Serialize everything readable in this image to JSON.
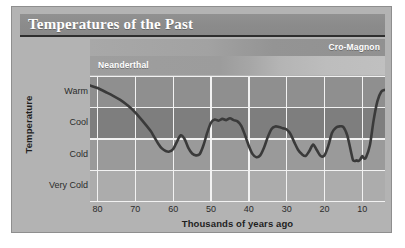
{
  "figure": {
    "title": "Temperatures of the Past",
    "border_color": "#8e8e8e",
    "panel_color": "#b3b3b3",
    "title_bar_color": "#8b8b8b"
  },
  "eras": [
    {
      "name": "cro-magnon",
      "label": "Cro-Magnon",
      "align": "right"
    },
    {
      "name": "neanderthal",
      "label": "Neanderthal",
      "align": "left"
    }
  ],
  "chart_data": {
    "type": "line",
    "title": "Temperatures of the Past",
    "xlabel": "Thousands of years ago",
    "ylabel": "Temperature",
    "xlim": [
      82,
      4
    ],
    "x_reversed": true,
    "xticks": [
      80,
      70,
      60,
      50,
      40,
      30,
      20,
      10
    ],
    "xtick_labels": [
      "80",
      "70",
      "60",
      "50",
      "40",
      "30",
      "20",
      "10"
    ],
    "yticks": [
      3,
      2,
      1,
      0
    ],
    "ytick_labels": [
      "Warm",
      "Cool",
      "Cold",
      "Very Cold"
    ],
    "ylim": [
      -0.5,
      3.5
    ],
    "grid": true,
    "legend": "none",
    "bands": [
      {
        "label": "Warm",
        "color": "#8f8f8f"
      },
      {
        "label": "Cool",
        "color": "#7e7e7e"
      },
      {
        "label": "Cold",
        "color": "#9a9a9a"
      },
      {
        "label": "Very Cold",
        "color": "#acacac"
      }
    ],
    "line_color": "#3a3a3a",
    "line_width": 2.6,
    "series": [
      {
        "name": "Temperature",
        "x": [
          82,
          80,
          78,
          76,
          74,
          72,
          70,
          68,
          66,
          65,
          64,
          63,
          62,
          61,
          60,
          59,
          58,
          57,
          56,
          55,
          54,
          53,
          52,
          51,
          50,
          49,
          48,
          47,
          46,
          45,
          44,
          43,
          42,
          41,
          40,
          39,
          38,
          37,
          36,
          35,
          34,
          33,
          32,
          31,
          30,
          29,
          28,
          27,
          26,
          25,
          24,
          23,
          22,
          21,
          20,
          19,
          18,
          17,
          16,
          15,
          14,
          13,
          12.5,
          12,
          11.5,
          11,
          10.5,
          10,
          9.5,
          9,
          8,
          7,
          6,
          5,
          4
        ],
        "y": [
          3.2,
          3.12,
          3.0,
          2.88,
          2.74,
          2.56,
          2.34,
          2.06,
          1.76,
          1.56,
          1.36,
          1.2,
          1.12,
          1.1,
          1.18,
          1.42,
          1.62,
          1.5,
          1.22,
          1.04,
          0.98,
          1.02,
          1.3,
          1.7,
          2.02,
          2.12,
          2.08,
          2.14,
          2.1,
          2.16,
          2.1,
          2.06,
          1.92,
          1.62,
          1.28,
          1.02,
          0.92,
          0.98,
          1.22,
          1.56,
          1.82,
          1.9,
          1.88,
          1.84,
          1.8,
          1.66,
          1.4,
          1.16,
          1.02,
          0.96,
          1.12,
          1.32,
          1.14,
          0.96,
          0.98,
          1.28,
          1.7,
          1.86,
          1.9,
          1.88,
          1.62,
          1.1,
          0.84,
          0.8,
          0.82,
          0.8,
          0.86,
          0.96,
          0.88,
          0.92,
          1.3,
          2.1,
          2.7,
          3.0,
          3.06
        ],
        "note": "Reconstructed glacial-interglacial temperature curve; y in band units where 0=Very Cold, 1=Cold, 2=Cool, 3=Warm"
      }
    ]
  }
}
